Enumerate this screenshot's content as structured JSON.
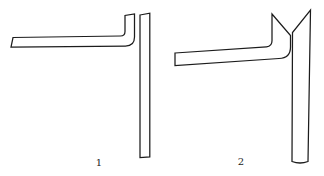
{
  "figures": [
    {
      "label": "1",
      "description": "right-angle bent tube with squared upward stub beside a straight vertical tube with squared top"
    },
    {
      "label": "2",
      "description": "right-angle bent tube with bevel-cut pointed stub beside a straight vertical tube with beveled top forming a V notch"
    }
  ],
  "drawing": {
    "ink_color": "#1c1c1c",
    "background_color": "#ffffff",
    "fig1": {
      "bent_tube": "M13,37.5 L120.5,36 Q125,36 125,31.5 L125,15.5 L134.5,14 L134.5,37 Q134.5,46 125.5,46 L11,47 Z",
      "straight_tube": "M140,15 L149.8,13.2 L149.8,156.8 L140,157.6 Z"
    },
    "fig2": {
      "bent_tube": "M175,53 L266.5,46.8 Q272,46.4 272,40.8 L272,14 L290.5,35.5 L290.5,47 Q290.5,58.2 279,58.5 L175,65.5 Z",
      "straight_tube": "M292.5,32.5 L292,161.5 Q300,164.5 308,161.5 L310.5,10 Z"
    }
  }
}
